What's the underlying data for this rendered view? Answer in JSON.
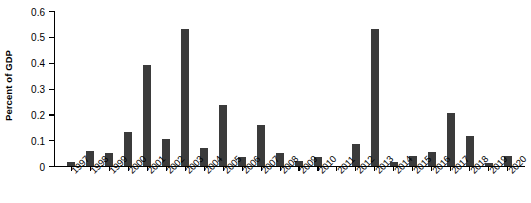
{
  "chart_data": {
    "type": "bar",
    "title": "",
    "subtitle": "",
    "xlabel": "",
    "ylabel": "Percent of GDP",
    "ylim": [
      0,
      0.6
    ],
    "ytick_labels": [
      "0",
      "0.1",
      "0.2",
      "0.3",
      "0.4",
      "0.5",
      "0.6"
    ],
    "ytick_values": [
      0,
      0.1,
      0.2,
      0.3,
      0.4,
      0.5,
      0.6
    ],
    "grid": false,
    "legend": null,
    "bar_color": "#3b3b3b",
    "axis_color": "#000000",
    "background_color": "#ffffff",
    "categories": [
      "1997",
      "1998",
      "1999",
      "2000",
      "2001",
      "2002",
      "2003",
      "2004",
      "2005",
      "2006",
      "2007",
      "2008",
      "2009",
      "2010",
      "2011",
      "2012",
      "2013",
      "2014",
      "2015",
      "2016",
      "2017",
      "2018",
      "2019",
      "2020"
    ],
    "values": [
      0.015,
      0.06,
      0.05,
      0.13,
      0.39,
      0.105,
      0.53,
      0.07,
      0.235,
      0.035,
      0.16,
      0.05,
      0.02,
      0.035,
      0.0,
      0.085,
      0.53,
      0.015,
      0.04,
      0.055,
      0.205,
      0.115,
      0.01,
      0.04
    ]
  }
}
